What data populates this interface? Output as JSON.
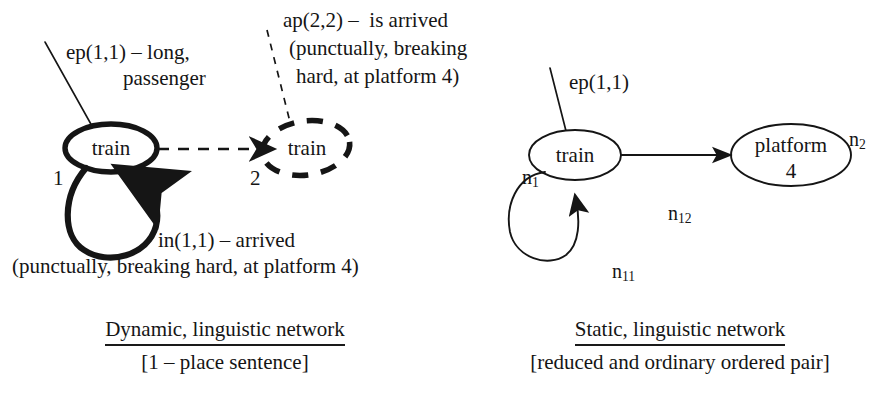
{
  "figure": {
    "left_diagram": {
      "nodes": [
        {
          "id": "n1-dynamic",
          "label": "train",
          "index": "1",
          "style": "solid-bold"
        },
        {
          "id": "n2-dynamic",
          "label": "train",
          "index": "2",
          "style": "dashed-bold"
        }
      ],
      "annotations": [
        {
          "id": "ep11",
          "lines": [
            "ep(1,1) – long,",
            "passenger"
          ]
        },
        {
          "id": "ap22",
          "lines": [
            "ap(2,2) –  is arrived",
            "(punctually, breaking",
            "hard, at platform 4)"
          ]
        },
        {
          "id": "in11",
          "lines": [
            "in(1,1) – arrived",
            "(punctually, breaking hard, at platform 4)"
          ]
        }
      ],
      "caption": {
        "title": "Dynamic, linguistic network",
        "subtitle": "[1 – place sentence]"
      }
    },
    "right_diagram": {
      "nodes": [
        {
          "id": "n1-static",
          "label": "train",
          "marker": "n1",
          "marker_base": "n",
          "marker_sub": "1"
        },
        {
          "id": "n2-static",
          "label_line1": "platform",
          "label_line2": "4",
          "marker": "n2",
          "marker_base": "n",
          "marker_sub": "2"
        }
      ],
      "edges": [
        {
          "id": "self-loop",
          "marker_base": "n",
          "marker_sub": "11"
        },
        {
          "id": "train-to-platform",
          "marker_base": "n",
          "marker_sub": "12"
        }
      ],
      "annotations": [
        {
          "id": "ep11-static",
          "lines": [
            "ep(1,1)"
          ]
        }
      ],
      "caption": {
        "title": "Static, linguistic network",
        "subtitle": "[reduced and ordinary ordered pair]"
      }
    }
  },
  "colors": {
    "ink": "#151515",
    "paper": "#ffffff"
  }
}
